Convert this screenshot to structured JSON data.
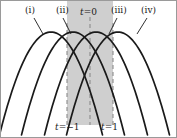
{
  "figure": {
    "name": "overlapping-parabolas-diagram",
    "background_color": "#ffffff",
    "border_color": "#9a9a9a",
    "curve_color": "#1a1a1a",
    "shade_color": "#cfcfcf",
    "dash_color": "#8c8c8c"
  },
  "curve_labels": [
    {
      "id": "i",
      "text": "(i)",
      "x": 24,
      "y": 5,
      "leader": {
        "x1": 33,
        "y1": 17,
        "x2": 42,
        "y2": 33
      }
    },
    {
      "id": "ii",
      "text": "(ii)",
      "x": 55,
      "y": 5,
      "leader": {
        "x1": 62,
        "y1": 17,
        "x2": 70,
        "y2": 33
      }
    },
    {
      "id": "iii",
      "text": "(iii)",
      "x": 110,
      "y": 5,
      "leader": {
        "x1": 116,
        "y1": 17,
        "x2": 108,
        "y2": 33
      }
    },
    {
      "id": "iv",
      "text": "(iv)",
      "x": 140,
      "y": 5,
      "leader": {
        "x1": 146,
        "y1": 17,
        "x2": 136,
        "y2": 33
      }
    }
  ],
  "axis_labels": {
    "t0": {
      "var": "t",
      "eq": "=0",
      "x": 79,
      "y": 7
    },
    "tminus1": {
      "var": "t",
      "eq": "=−1",
      "x": 54,
      "y": 122
    },
    "t1": {
      "var": "t",
      "eq": "=1",
      "x": 100,
      "y": 122
    }
  },
  "chart_data": {
    "type": "line",
    "title": "",
    "xlabel": "",
    "ylabel": "",
    "grid": false,
    "legend": "none",
    "xlim": [
      0,
      175
    ],
    "ylim": [
      136,
      0
    ],
    "shaded_band": {
      "x_start": 66,
      "x_end": 112,
      "fill": "#cfcfcf"
    },
    "dashed_lines": [
      {
        "label": "t=-1",
        "x": 66
      },
      {
        "label": "t=0",
        "x": 89
      },
      {
        "label": "t=1",
        "x": 112
      }
    ],
    "series": [
      {
        "name": "(i)",
        "peak_x": 50,
        "peak_y": 31,
        "width": 52,
        "depth": 105
      },
      {
        "name": "(ii)",
        "peak_x": 72,
        "peak_y": 31,
        "width": 52,
        "depth": 105
      },
      {
        "name": "(iii)",
        "peak_x": 95,
        "peak_y": 31,
        "width": 52,
        "depth": 105
      },
      {
        "name": "(iv)",
        "peak_x": 117,
        "peak_y": 31,
        "width": 52,
        "depth": 105
      }
    ]
  }
}
